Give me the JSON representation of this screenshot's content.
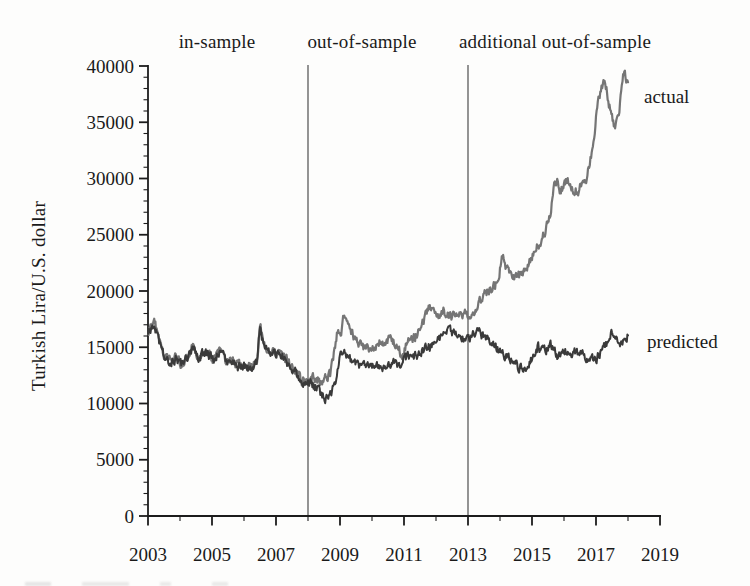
{
  "chart_data": {
    "type": "line",
    "title": "",
    "xlabel": "",
    "ylabel": "Turkish Lira/U.S. dollar",
    "xlim": [
      2003,
      2019
    ],
    "ylim": [
      0,
      40000
    ],
    "x_data_end": 2018,
    "grid": false,
    "axis_color": "#1c1c1c",
    "x_major_ticks": [
      2003,
      2005,
      2007,
      2009,
      2011,
      2013,
      2015,
      2017,
      2019
    ],
    "x_minor_ticks": [
      2004,
      2006,
      2008,
      2010,
      2012,
      2014,
      2016,
      2018
    ],
    "y_major_ticks": [
      0,
      5000,
      10000,
      15000,
      20000,
      25000,
      30000,
      35000,
      40000
    ],
    "y_minor_step": 1000,
    "separators": [
      2008,
      2013
    ],
    "regions": [
      {
        "label": "in-sample",
        "from": 2003,
        "to": 2008
      },
      {
        "label": "out-of-sample",
        "from": 2008,
        "to": 2013
      },
      {
        "label": "additional out-of-sample",
        "from": 2013,
        "to": 2019
      }
    ],
    "series": [
      {
        "name": "actual",
        "color": "#757575",
        "points": [
          [
            2003.0,
            16400
          ],
          [
            2003.1,
            17000
          ],
          [
            2003.2,
            17400
          ],
          [
            2003.35,
            15400
          ],
          [
            2003.5,
            14200
          ],
          [
            2003.7,
            13800
          ],
          [
            2003.9,
            14200
          ],
          [
            2004.05,
            13400
          ],
          [
            2004.25,
            14300
          ],
          [
            2004.4,
            15000
          ],
          [
            2004.6,
            14100
          ],
          [
            2004.75,
            14700
          ],
          [
            2004.9,
            14400
          ],
          [
            2005.05,
            13900
          ],
          [
            2005.2,
            14600
          ],
          [
            2005.35,
            14200
          ],
          [
            2005.5,
            13600
          ],
          [
            2005.65,
            13900
          ],
          [
            2005.8,
            13400
          ],
          [
            2006.0,
            13400
          ],
          [
            2006.2,
            13300
          ],
          [
            2006.4,
            13600
          ],
          [
            2006.5,
            17000
          ],
          [
            2006.6,
            15600
          ],
          [
            2006.75,
            14700
          ],
          [
            2006.9,
            14600
          ],
          [
            2007.05,
            14300
          ],
          [
            2007.2,
            14500
          ],
          [
            2007.35,
            13800
          ],
          [
            2007.5,
            13300
          ],
          [
            2007.65,
            12800
          ],
          [
            2007.8,
            12100
          ],
          [
            2007.95,
            12000
          ],
          [
            2008.1,
            12400
          ],
          [
            2008.25,
            12200
          ],
          [
            2008.4,
            11900
          ],
          [
            2008.55,
            12300
          ],
          [
            2008.7,
            12600
          ],
          [
            2008.82,
            14600
          ],
          [
            2008.92,
            16600
          ],
          [
            2009.02,
            16100
          ],
          [
            2009.12,
            18000
          ],
          [
            2009.25,
            17000
          ],
          [
            2009.4,
            16100
          ],
          [
            2009.55,
            15600
          ],
          [
            2009.7,
            15100
          ],
          [
            2009.85,
            15000
          ],
          [
            2010.0,
            15100
          ],
          [
            2010.2,
            15400
          ],
          [
            2010.4,
            15200
          ],
          [
            2010.6,
            15800
          ],
          [
            2010.75,
            15000
          ],
          [
            2010.95,
            14300
          ],
          [
            2011.1,
            15400
          ],
          [
            2011.25,
            15600
          ],
          [
            2011.4,
            16100
          ],
          [
            2011.6,
            17200
          ],
          [
            2011.8,
            18700
          ],
          [
            2011.95,
            18100
          ],
          [
            2012.1,
            17900
          ],
          [
            2012.25,
            18200
          ],
          [
            2012.4,
            17900
          ],
          [
            2012.55,
            17700
          ],
          [
            2012.7,
            18000
          ],
          [
            2012.85,
            17900
          ],
          [
            2013.0,
            17900
          ],
          [
            2013.15,
            18300
          ],
          [
            2013.3,
            18700
          ],
          [
            2013.5,
            19600
          ],
          [
            2013.7,
            20100
          ],
          [
            2013.85,
            20500
          ],
          [
            2014.0,
            22000
          ],
          [
            2014.05,
            23200
          ],
          [
            2014.2,
            21900
          ],
          [
            2014.35,
            21400
          ],
          [
            2014.5,
            21200
          ],
          [
            2014.65,
            21500
          ],
          [
            2014.8,
            22000
          ],
          [
            2014.95,
            22600
          ],
          [
            2015.1,
            23600
          ],
          [
            2015.25,
            24300
          ],
          [
            2015.4,
            25200
          ],
          [
            2015.55,
            26500
          ],
          [
            2015.7,
            29400
          ],
          [
            2015.78,
            30000
          ],
          [
            2015.88,
            28900
          ],
          [
            2016.0,
            29300
          ],
          [
            2016.1,
            29900
          ],
          [
            2016.25,
            28900
          ],
          [
            2016.4,
            28800
          ],
          [
            2016.55,
            29500
          ],
          [
            2016.7,
            29900
          ],
          [
            2016.8,
            31200
          ],
          [
            2016.9,
            32800
          ],
          [
            2017.0,
            35600
          ],
          [
            2017.1,
            37200
          ],
          [
            2017.2,
            38200
          ],
          [
            2017.28,
            39000
          ],
          [
            2017.38,
            37000
          ],
          [
            2017.48,
            35600
          ],
          [
            2017.58,
            34600
          ],
          [
            2017.68,
            35300
          ],
          [
            2017.78,
            37200
          ],
          [
            2017.88,
            39600
          ],
          [
            2017.94,
            38800
          ],
          [
            2018.0,
            38300
          ]
        ]
      },
      {
        "name": "predicted",
        "color": "#3a3a3a",
        "points": [
          [
            2003.0,
            16300
          ],
          [
            2003.1,
            16800
          ],
          [
            2003.2,
            17200
          ],
          [
            2003.35,
            15300
          ],
          [
            2003.5,
            14100
          ],
          [
            2003.7,
            13700
          ],
          [
            2003.9,
            14100
          ],
          [
            2004.05,
            13300
          ],
          [
            2004.25,
            14200
          ],
          [
            2004.4,
            14900
          ],
          [
            2004.6,
            14000
          ],
          [
            2004.75,
            14600
          ],
          [
            2004.9,
            14300
          ],
          [
            2005.05,
            13800
          ],
          [
            2005.2,
            14500
          ],
          [
            2005.35,
            14100
          ],
          [
            2005.5,
            13500
          ],
          [
            2005.65,
            13800
          ],
          [
            2005.8,
            13300
          ],
          [
            2006.0,
            13300
          ],
          [
            2006.2,
            13200
          ],
          [
            2006.4,
            13500
          ],
          [
            2006.5,
            16600
          ],
          [
            2006.6,
            15400
          ],
          [
            2006.75,
            14600
          ],
          [
            2006.9,
            14500
          ],
          [
            2007.05,
            14200
          ],
          [
            2007.2,
            14400
          ],
          [
            2007.35,
            13700
          ],
          [
            2007.5,
            13200
          ],
          [
            2007.65,
            12700
          ],
          [
            2007.8,
            12000
          ],
          [
            2007.95,
            11900
          ],
          [
            2008.1,
            11800
          ],
          [
            2008.25,
            11400
          ],
          [
            2008.4,
            10900
          ],
          [
            2008.55,
            10400
          ],
          [
            2008.7,
            10800
          ],
          [
            2008.82,
            11500
          ],
          [
            2008.95,
            13400
          ],
          [
            2009.1,
            15000
          ],
          [
            2009.25,
            14100
          ],
          [
            2009.4,
            13600
          ],
          [
            2009.55,
            13300
          ],
          [
            2009.7,
            13200
          ],
          [
            2009.85,
            13400
          ],
          [
            2010.0,
            13500
          ],
          [
            2010.2,
            13300
          ],
          [
            2010.4,
            13200
          ],
          [
            2010.6,
            13600
          ],
          [
            2010.8,
            13400
          ],
          [
            2011.0,
            13900
          ],
          [
            2011.2,
            14200
          ],
          [
            2011.4,
            14300
          ],
          [
            2011.6,
            14700
          ],
          [
            2011.8,
            15100
          ],
          [
            2012.0,
            15500
          ],
          [
            2012.2,
            16200
          ],
          [
            2012.35,
            16700
          ],
          [
            2012.5,
            16200
          ],
          [
            2012.65,
            16000
          ],
          [
            2012.8,
            15800
          ],
          [
            2013.0,
            15600
          ],
          [
            2013.15,
            16200
          ],
          [
            2013.3,
            16500
          ],
          [
            2013.45,
            16100
          ],
          [
            2013.6,
            15900
          ],
          [
            2013.8,
            15200
          ],
          [
            2014.0,
            14700
          ],
          [
            2014.2,
            14200
          ],
          [
            2014.4,
            13700
          ],
          [
            2014.6,
            13200
          ],
          [
            2014.75,
            13000
          ],
          [
            2014.9,
            13600
          ],
          [
            2015.05,
            14300
          ],
          [
            2015.2,
            15100
          ],
          [
            2015.4,
            14600
          ],
          [
            2015.6,
            15200
          ],
          [
            2015.8,
            14200
          ],
          [
            2016.0,
            14800
          ],
          [
            2016.2,
            14200
          ],
          [
            2016.4,
            14700
          ],
          [
            2016.6,
            14200
          ],
          [
            2016.8,
            14100
          ],
          [
            2016.95,
            13800
          ],
          [
            2017.1,
            14300
          ],
          [
            2017.25,
            15000
          ],
          [
            2017.4,
            15800
          ],
          [
            2017.55,
            16500
          ],
          [
            2017.7,
            15300
          ],
          [
            2017.85,
            15700
          ],
          [
            2018.0,
            16100
          ]
        ]
      }
    ]
  }
}
